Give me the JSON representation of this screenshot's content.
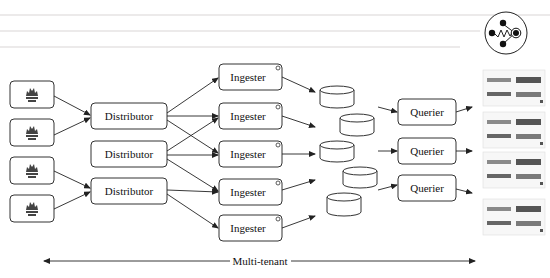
{
  "diagram": {
    "title_icon": "cortex-logo-icon",
    "prometheus_sources": [
      {
        "icon": "prometheus-icon"
      },
      {
        "icon": "prometheus-icon"
      },
      {
        "icon": "prometheus-icon"
      },
      {
        "icon": "prometheus-icon"
      }
    ],
    "distributors": [
      {
        "label": "Distributor"
      },
      {
        "label": "Distributor"
      },
      {
        "label": "Distributor"
      }
    ],
    "ingesters": [
      {
        "label": "Ingester"
      },
      {
        "label": "Ingester"
      },
      {
        "label": "Ingester"
      },
      {
        "label": "Ingester"
      },
      {
        "label": "Ingester"
      }
    ],
    "storage": [
      {
        "icon": "database-icon"
      },
      {
        "icon": "database-icon"
      },
      {
        "icon": "database-icon"
      },
      {
        "icon": "database-icon"
      },
      {
        "icon": "database-icon"
      }
    ],
    "queriers": [
      {
        "label": "Querier"
      },
      {
        "label": "Querier"
      },
      {
        "label": "Querier"
      }
    ],
    "dashboards": [
      {
        "icon": "dashboard-thumbnail"
      },
      {
        "icon": "dashboard-thumbnail"
      },
      {
        "icon": "dashboard-thumbnail"
      },
      {
        "icon": "dashboard-thumbnail"
      }
    ],
    "footer_label": "Multi-tenant"
  }
}
